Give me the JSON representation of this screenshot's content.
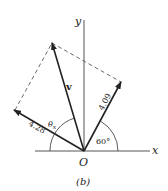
{
  "figure": {
    "caption": "(b)",
    "origin_label": "O",
    "x_axis_label": "x",
    "y_axis_label": "y"
  },
  "vectors": [
    {
      "name": "v",
      "label": "v",
      "description": "resultant vector"
    },
    {
      "name": "component-a",
      "label": "4.28",
      "description": "vector along 150° direction"
    },
    {
      "name": "component-b",
      "label": "4.09",
      "description": "vector at 60° from x-axis"
    }
  ],
  "angles": [
    {
      "label": "60°",
      "description": "angle between 4.09 vector and x-axis"
    },
    {
      "label": "θ",
      "subscript": "x",
      "description": "angle of v measured from x-axis"
    }
  ],
  "colors": {
    "line": "#222222",
    "dashed": "#444444",
    "background": "#ffffff"
  }
}
